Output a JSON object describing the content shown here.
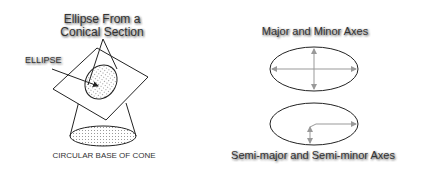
{
  "left_figure": {
    "title_line1": "Ellipse From a",
    "title_line2": "Conical Section",
    "ellipse_label": "ELLIPSE",
    "base_label": "CIRCULAR BASE OF CONE"
  },
  "right_figure": {
    "top_title": "Major and Minor Axes",
    "bottom_title": "Semi-major and Semi-minor Axes"
  },
  "colors": {
    "line": "#222222",
    "axis": "#999999",
    "text": "#333333",
    "dots": "#777777"
  }
}
